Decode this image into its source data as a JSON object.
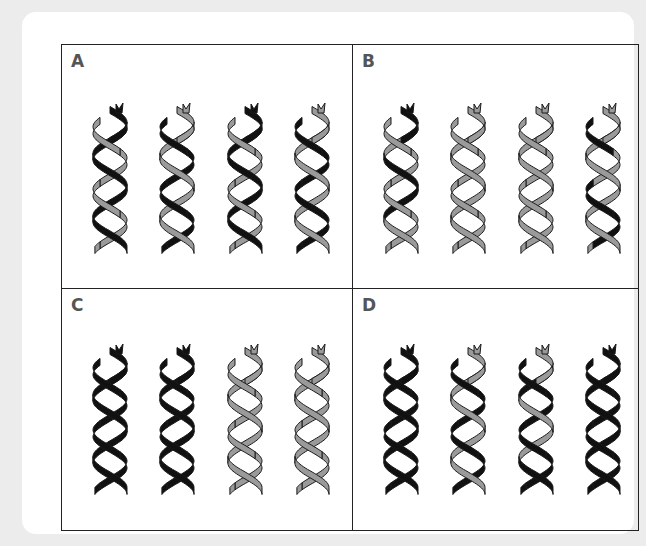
{
  "figure": {
    "panels": [
      {
        "label": "A",
        "helices": [
          {
            "strand_a": "black",
            "strand_b": "gray"
          },
          {
            "strand_a": "gray",
            "strand_b": "black"
          },
          {
            "strand_a": "black",
            "strand_b": "gray"
          },
          {
            "strand_a": "gray",
            "strand_b": "black"
          }
        ]
      },
      {
        "label": "B",
        "helices": [
          {
            "strand_a": "mixed-black",
            "strand_b": "gray"
          },
          {
            "strand_a": "gray",
            "strand_b": "gray"
          },
          {
            "strand_a": "gray",
            "strand_b": "gray"
          },
          {
            "strand_a": "gray",
            "strand_b": "mixed-black"
          }
        ]
      },
      {
        "label": "C",
        "helices": [
          {
            "strand_a": "black",
            "strand_b": "black"
          },
          {
            "strand_a": "black",
            "strand_b": "black"
          },
          {
            "strand_a": "gray",
            "strand_b": "gray"
          },
          {
            "strand_a": "gray",
            "strand_b": "gray"
          }
        ]
      },
      {
        "label": "D",
        "helices": [
          {
            "strand_a": "black",
            "strand_b": "black"
          },
          {
            "strand_a": "gray",
            "strand_b": "black"
          },
          {
            "strand_a": "mixed-gray",
            "strand_b": "black"
          },
          {
            "strand_a": "black",
            "strand_b": "black"
          }
        ]
      }
    ],
    "colors": {
      "black": "#111111",
      "gray": "#9a9a9a",
      "outline": "#1a1a1a",
      "border": "#222222",
      "background": "#ececec",
      "card": "#ffffff",
      "label": "#555555"
    }
  }
}
